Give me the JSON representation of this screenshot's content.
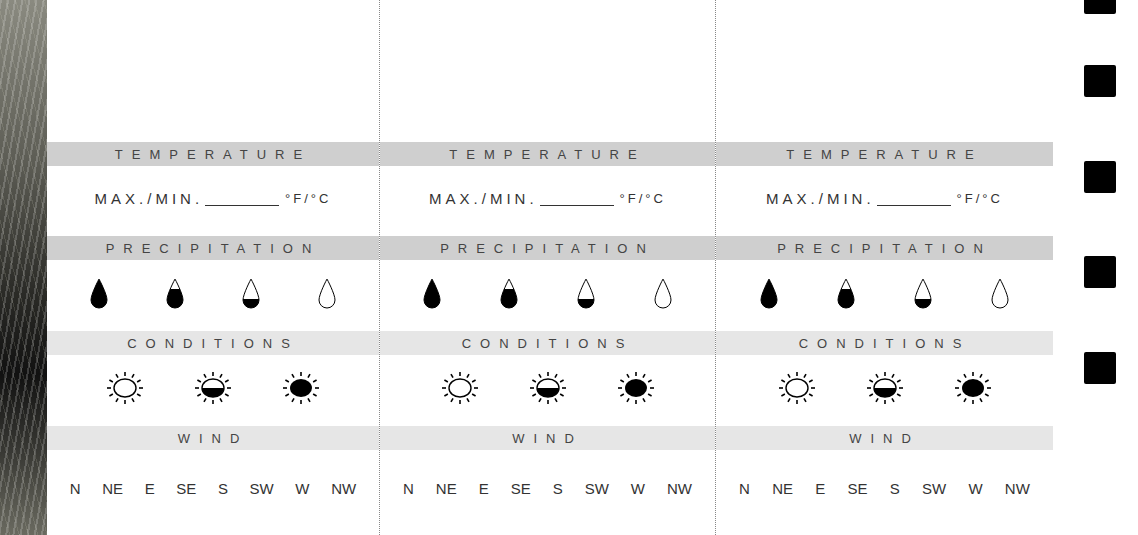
{
  "columns": [
    {
      "temperature_label": "TEMPERATURE",
      "maxmin_label": "MAX./MIN.",
      "unit_label": "°F/°C",
      "precipitation_label": "PRECIPITATION",
      "precipitation_icons": [
        "drop-full-icon",
        "drop-three-quarter-icon",
        "drop-quarter-icon",
        "drop-empty-icon"
      ],
      "conditions_label": "CONDITIONS",
      "conditions_icons": [
        "sun-clear-icon",
        "sun-half-icon",
        "sun-dark-icon"
      ],
      "wind_label": "WIND",
      "wind_directions": [
        "N",
        "NE",
        "E",
        "SE",
        "S",
        "SW",
        "W",
        "NW"
      ]
    },
    {
      "temperature_label": "TEMPERATURE",
      "maxmin_label": "MAX./MIN.",
      "unit_label": "°F/°C",
      "precipitation_label": "PRECIPITATION",
      "precipitation_icons": [
        "drop-full-icon",
        "drop-three-quarter-icon",
        "drop-quarter-icon",
        "drop-empty-icon"
      ],
      "conditions_label": "CONDITIONS",
      "conditions_icons": [
        "sun-clear-icon",
        "sun-half-icon",
        "sun-dark-icon"
      ],
      "wind_label": "WIND",
      "wind_directions": [
        "N",
        "NE",
        "E",
        "SE",
        "S",
        "SW",
        "W",
        "NW"
      ]
    },
    {
      "temperature_label": "TEMPERATURE",
      "maxmin_label": "MAX./MIN.",
      "unit_label": "°F/°C",
      "precipitation_label": "PRECIPITATION",
      "precipitation_icons": [
        "drop-full-icon",
        "drop-three-quarter-icon",
        "drop-quarter-icon",
        "drop-empty-icon"
      ],
      "conditions_label": "CONDITIONS",
      "conditions_icons": [
        "sun-clear-icon",
        "sun-half-icon",
        "sun-dark-icon"
      ],
      "wind_label": "WIND",
      "wind_directions": [
        "N",
        "NE",
        "E",
        "SE",
        "S",
        "SW",
        "W",
        "NW"
      ]
    }
  ],
  "side_markers": 5,
  "colors": {
    "band_dark": "#cfcfcf",
    "band_light": "#e6e6e6",
    "ink": "#000000",
    "text": "#333333"
  }
}
